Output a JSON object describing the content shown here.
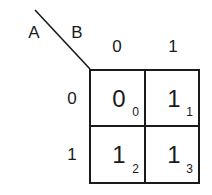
{
  "kmap": {
    "row_variable": "A",
    "col_variable": "B",
    "col_headers": [
      "0",
      "1"
    ],
    "row_headers": [
      "0",
      "1"
    ],
    "cells": [
      {
        "value": "0",
        "index": "0"
      },
      {
        "value": "1",
        "index": "1"
      },
      {
        "value": "1",
        "index": "2"
      },
      {
        "value": "1",
        "index": "3"
      }
    ]
  },
  "colors": {
    "ink": "#1a1a1a",
    "background": "#ffffff"
  }
}
